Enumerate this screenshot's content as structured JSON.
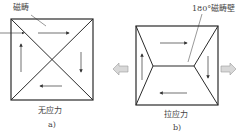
{
  "panel_a": {
    "top_label": "磁畴",
    "caption": "无应力",
    "sub_label": "a)"
  },
  "panel_b": {
    "top_label": "180°磁畴壁",
    "caption": "拉应力",
    "sub_label": "b)"
  },
  "colors": {
    "line": "#2a2a2a",
    "arrow_fill": "#d8d8d8",
    "arrow_stroke": "#9a9a9a"
  }
}
